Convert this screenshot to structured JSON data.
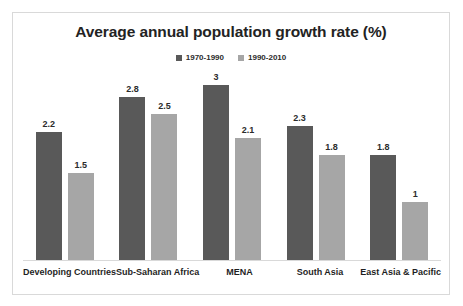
{
  "chart_data": {
    "type": "bar",
    "title": "Average annual population growth rate (%)",
    "xlabel": "",
    "ylabel": "",
    "ylim": [
      0,
      3
    ],
    "grid": false,
    "legend_position": "top-center",
    "categories": [
      "Developing Countries",
      "Sub-Saharan Africa",
      "MENA",
      "South Asia",
      "East Asia & Pacific"
    ],
    "series": [
      {
        "name": "1970-1990",
        "color": "#595959",
        "values": [
          2.2,
          2.8,
          3,
          2.3,
          1.8
        ],
        "labels": [
          "2.2",
          "2.8",
          "3",
          "2.3",
          "1.8"
        ]
      },
      {
        "name": "1990-2010",
        "color": "#a6a6a6",
        "values": [
          1.5,
          2.5,
          2.1,
          1.8,
          1
        ],
        "labels": [
          "1.5",
          "2.5",
          "2.1",
          "1.8",
          "1"
        ]
      }
    ]
  },
  "legend": {
    "entries": [
      {
        "label": "1970-1990",
        "color": "#595959"
      },
      {
        "label": "1990-2010",
        "color": "#a6a6a6"
      }
    ]
  },
  "frame": {
    "border_color": "#d9d9d9",
    "background": "#ffffff"
  }
}
